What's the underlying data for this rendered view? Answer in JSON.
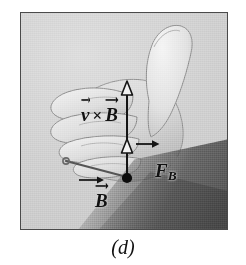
{
  "figure": {
    "caption": "(d)",
    "frame": {
      "border_color": "#4a4a4a",
      "background_color": "#cdcdcd"
    },
    "labels": [
      {
        "id": "v-cross-b",
        "name": "v-cross-b-label",
        "symbol_1": "v",
        "operator": "×",
        "symbol_2": "B",
        "plain_text": "v × B",
        "description": "direction of v vector crossed with B vector, along the curled fingers / vertical arrow"
      },
      {
        "id": "force",
        "name": "magnetic-force-label",
        "symbol": "F",
        "subscript": "B",
        "plain_text": "F_B",
        "description": "magnetic force on the charge, points along the thumb"
      },
      {
        "id": "bfield",
        "name": "b-field-label",
        "symbol": "B",
        "plain_text": "B",
        "description": "magnetic field vector directed to the lower left"
      }
    ],
    "vectors": [
      {
        "id": "vertical-axis",
        "name": "v-cross-b-arrow",
        "kind": "line-with-two-open-arrowheads",
        "from": [
          127,
          177
        ],
        "to": [
          127,
          85
        ],
        "color": "#1a1a1a"
      },
      {
        "id": "b-field-arrow",
        "name": "b-field-arrow",
        "kind": "arrow",
        "from": [
          127,
          177
        ],
        "to": [
          63,
          160
        ],
        "color": "#4d4d4d"
      },
      {
        "id": "fb-arrow",
        "name": "force-arrow-tick",
        "kind": "short-arrow",
        "from": [
          136,
          143
        ],
        "to": [
          158,
          143
        ],
        "color": "#1a1a1a"
      }
    ],
    "markers": [
      {
        "id": "charge-point",
        "name": "charge-dot",
        "kind": "filled-dot",
        "at": [
          127,
          177
        ],
        "color": "#0d0d0d"
      },
      {
        "id": "mid-arrowhead",
        "name": "mid-open-arrowhead",
        "kind": "open-triangle",
        "at": [
          127,
          145
        ]
      },
      {
        "id": "top-arrowhead",
        "name": "top-open-arrowhead",
        "kind": "open-triangle",
        "at": [
          127,
          87
        ]
      }
    ],
    "colors": {
      "ink": "#111111",
      "frame": "#4a4a4a",
      "photo_light": "#dcdcdc",
      "photo_mid": "#cdcdcd",
      "photo_shadow": "#5f5f5f",
      "skin_light": "#e3e3e3",
      "skin_mid": "#d2d2d2",
      "skin_line": "#7a7a7a"
    }
  }
}
